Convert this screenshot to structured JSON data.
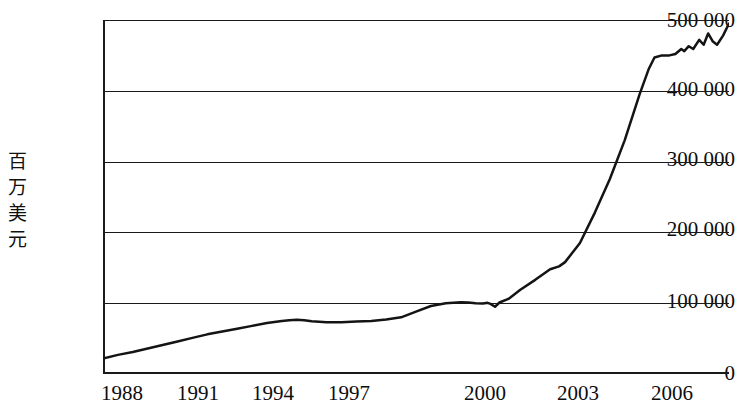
{
  "chart_data": {
    "type": "line",
    "title": "",
    "subtitle": "",
    "xlabel": "",
    "ylabel": "百万美元",
    "ylabel_chars": [
      "百",
      "万",
      "美",
      "元"
    ],
    "xlim": [
      1987,
      2008
    ],
    "ylim": [
      0,
      500000
    ],
    "grid": true,
    "legend": "none",
    "y_ticks": [
      0,
      100000,
      200000,
      300000,
      400000,
      500000
    ],
    "y_tick_labels": [
      "0",
      "100 000",
      "200 000",
      "300 000",
      "400 000",
      "500 000"
    ],
    "x_ticks": [
      1988,
      1991,
      1994,
      1997,
      2000,
      2003,
      2006
    ],
    "x_tick_labels": [
      "1988",
      "1991",
      "1994",
      "1997",
      "2000",
      "2003",
      "2006"
    ],
    "series": [
      {
        "name": "",
        "x": [
          1987.0,
          1987.5,
          1988.0,
          1988.5,
          1989.0,
          1989.5,
          1990.0,
          1990.5,
          1991.0,
          1991.5,
          1992.0,
          1992.5,
          1993.0,
          1993.25,
          1993.5,
          1993.75,
          1994.0,
          1994.5,
          1995.0,
          1995.5,
          1996.0,
          1996.5,
          1997.0,
          1997.5,
          1998.0,
          1998.5,
          1999.0,
          1999.25,
          1999.5,
          1999.75,
          1999.9,
          2000.0,
          2000.15,
          2000.3,
          2000.6,
          2001.0,
          2001.5,
          2002.0,
          2002.3,
          2002.5,
          2003.0,
          2003.5,
          2004.0,
          2004.5,
          2005.0,
          2005.3,
          2005.5,
          2005.75,
          2006.0,
          2006.2,
          2006.4,
          2006.5,
          2006.65,
          2006.8,
          2007.0,
          2007.15,
          2007.3,
          2007.45,
          2007.6,
          2007.8,
          2008.0
        ],
        "values": [
          22000,
          27000,
          31000,
          36000,
          41000,
          46000,
          51000,
          56000,
          60000,
          64000,
          68000,
          72000,
          75000,
          76000,
          76500,
          76000,
          74500,
          73000,
          73000,
          74000,
          75000,
          77000,
          80000,
          88000,
          96000,
          100000,
          101500,
          101000,
          100000,
          99500,
          100500,
          99000,
          95000,
          101000,
          106000,
          119000,
          133000,
          148000,
          152000,
          158000,
          185000,
          228000,
          275000,
          330000,
          395000,
          430000,
          447000,
          450000,
          450000,
          452000,
          459000,
          456000,
          463000,
          459000,
          472000,
          465000,
          481000,
          470000,
          465000,
          478000,
          495000
        ]
      }
    ],
    "annotations": []
  },
  "axis": {
    "y_title": "百万美元"
  },
  "colors": {
    "line": "#141414",
    "grid": "#1a1a1a",
    "axis": "#1a1a1a",
    "background": "#ffffff"
  }
}
